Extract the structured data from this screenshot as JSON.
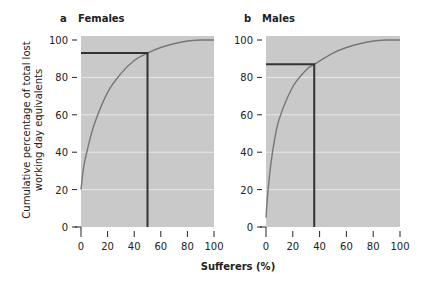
{
  "chart_data": [
    {
      "type": "line",
      "panel": "a",
      "title": "Females",
      "xlabel": "Sufferers (%)",
      "ylabel": "Cumulative percentage of total lost working day equivalents",
      "xlim": [
        0,
        100
      ],
      "ylim": [
        0,
        100
      ],
      "xticks": [
        0,
        20,
        40,
        60,
        80,
        100
      ],
      "yticks": [
        0,
        20,
        40,
        60,
        80,
        100
      ],
      "grid": "horizontal white lines at 20,40,60,80",
      "series": [
        {
          "name": "Females cumulative curve",
          "x": [
            0,
            2,
            5,
            10,
            20,
            30,
            40,
            50,
            60,
            70,
            80,
            90,
            100
          ],
          "y": [
            20,
            32,
            42,
            55,
            72,
            82,
            89,
            93,
            96,
            98,
            99.5,
            100,
            100
          ]
        }
      ],
      "annotation": {
        "x": 50,
        "y": 93,
        "description": "reference lines: 50% of sufferers account for ~93% of lost working days"
      }
    },
    {
      "type": "line",
      "panel": "b",
      "title": "Males",
      "xlabel": "Sufferers (%)",
      "xlim": [
        0,
        100
      ],
      "ylim": [
        0,
        100
      ],
      "xticks": [
        0,
        20,
        40,
        60,
        80,
        100
      ],
      "yticks": [
        0,
        20,
        40,
        60,
        80,
        100
      ],
      "grid": "horizontal white lines at 20,40,60,80",
      "series": [
        {
          "name": "Males cumulative curve",
          "x": [
            0,
            1,
            3,
            6,
            10,
            20,
            30,
            36,
            50,
            60,
            70,
            80,
            90,
            100
          ],
          "y": [
            5,
            15,
            30,
            45,
            58,
            75,
            84,
            87,
            93,
            96,
            98,
            99.5,
            100,
            100
          ]
        }
      ],
      "annotation": {
        "x": 36,
        "y": 87,
        "description": "reference lines: 36% of sufferers account for ~87% of lost working days"
      }
    }
  ],
  "labels": {
    "panel_a_letter": "a",
    "panel_a_title": "Females",
    "panel_b_letter": "b",
    "panel_b_title": "Males",
    "y_axis_line1": "Cumulative percentage of total lost",
    "y_axis_line2": "working day equivalents",
    "x_axis": "Sufferers (%)"
  },
  "colors": {
    "plot_bg": "#c9c9c9",
    "grid": "#e8e8e8",
    "curve": "#777777",
    "reference_line": "#333333",
    "text": "#222222"
  }
}
